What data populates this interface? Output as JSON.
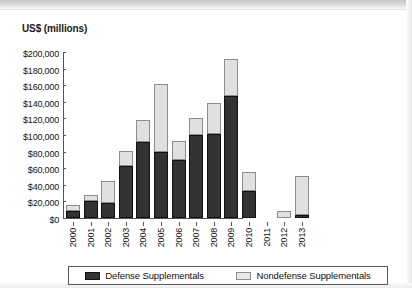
{
  "figure": {
    "y_axis_title": "US$ (millions)"
  },
  "legend": {
    "position": "bottom",
    "entries": [
      {
        "label": "Defense Supplementals",
        "color": "#333333",
        "swatch": "defense-swatch"
      },
      {
        "label": "Nondefense Supplementals",
        "color": "#e8e8e8",
        "swatch": "nondefense-swatch"
      }
    ]
  },
  "chart_data": {
    "type": "bar",
    "stacked": true,
    "title": "",
    "subtitle": "",
    "xlabel": "",
    "ylabel": "US$ (millions)",
    "ylim": [
      0,
      200000
    ],
    "ytick_labels": [
      "$200,000",
      "$180,000",
      "$160,000",
      "$140,000",
      "$120,000",
      "$100,000",
      "$80,000",
      "$60,000",
      "$40,000",
      "$20,000",
      "$0"
    ],
    "ytick_values": [
      200000,
      180000,
      160000,
      140000,
      120000,
      100000,
      80000,
      60000,
      40000,
      20000,
      0
    ],
    "grid": false,
    "legend_position": "bottom",
    "categories": [
      "2000",
      "2001",
      "2002",
      "2003",
      "2004",
      "2005",
      "2006",
      "2007",
      "2008",
      "2009",
      "2010",
      "2011",
      "2012",
      "2013"
    ],
    "series": [
      {
        "name": "Defense Supplementals",
        "color": "#333333",
        "values": [
          9000,
          20000,
          18000,
          63000,
          92000,
          79000,
          70000,
          100000,
          101000,
          147000,
          33000,
          0,
          0,
          4000
        ]
      },
      {
        "name": "Nondefense Supplementals",
        "color": "#e0e0e0",
        "values": [
          7000,
          8000,
          27000,
          18000,
          26000,
          82000,
          23000,
          21000,
          38000,
          44000,
          23000,
          0,
          8000,
          47000
        ]
      }
    ],
    "totals": [
      16000,
      28000,
      45000,
      81000,
      118000,
      161000,
      93000,
      121000,
      139000,
      191000,
      56000,
      0,
      8000,
      51000
    ]
  }
}
